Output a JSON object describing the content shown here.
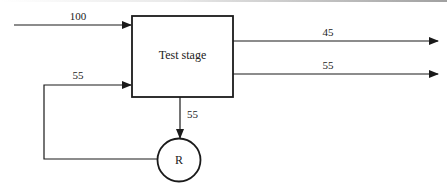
{
  "diagram": {
    "type": "process-flow",
    "colors": {
      "stroke": "#1a1a1a",
      "text": "#222222",
      "background": "#ffffff"
    },
    "nodes": [
      {
        "id": "test_stage",
        "shape": "rectangle",
        "label": "Test stage"
      },
      {
        "id": "R",
        "shape": "circle",
        "label": "R"
      }
    ],
    "flows": {
      "input": {
        "label": "100"
      },
      "output_top": {
        "label": "45"
      },
      "output_bottom": {
        "label": "55"
      },
      "to_repair": {
        "label": "55"
      },
      "feedback": {
        "label": "55"
      }
    }
  }
}
